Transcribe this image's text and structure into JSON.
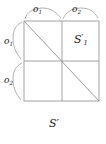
{
  "figure": {
    "caption": "S′",
    "grid": {
      "left": 24,
      "top": 21,
      "right": 99,
      "bottom": 101,
      "mid_x": 62,
      "mid_y": 61,
      "line_color": "#9a9a9a",
      "diagonal": {
        "from": [
          24,
          21
        ],
        "to": [
          99,
          101
        ]
      }
    },
    "braces": {
      "top": [
        {
          "label": "o",
          "subscript": "1",
          "from_x": 24,
          "to_x": 62
        },
        {
          "label": "o",
          "subscript": "2",
          "from_x": 62,
          "to_x": 99
        }
      ],
      "left": [
        {
          "label": "o",
          "subscript": "1",
          "from_y": 21,
          "to_y": 61
        },
        {
          "label": "o",
          "subscript": "2",
          "from_y": 61,
          "to_y": 101
        }
      ]
    },
    "cell_labels": [
      {
        "name": "s-prime-1",
        "base": "S",
        "prime": "′",
        "subscript": "1",
        "cell": "top-right"
      }
    ],
    "text_color": "#1a1a1a"
  }
}
